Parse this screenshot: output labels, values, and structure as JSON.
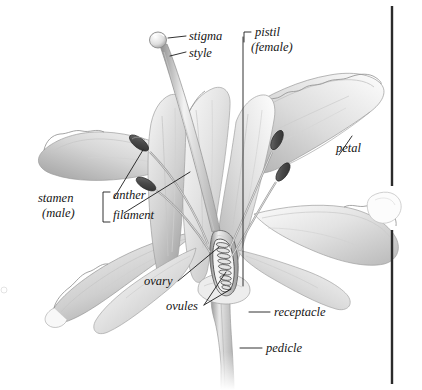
{
  "figure": {
    "style": "grayscale pencil botanical illustration",
    "background_color": "#ffffff",
    "ink_color": "#1b1b1b",
    "rule_color": "#2b2b2b"
  },
  "labels": {
    "stigma": "stigma",
    "style": "style",
    "pistil_line1": "pistil",
    "pistil_line2": "(female)",
    "petal": "petal",
    "stamen_line1": "stamen",
    "stamen_line2": "(male)",
    "anther": "anther",
    "filament": "filament",
    "ovary": "ovary",
    "ovules": "ovules",
    "receptacle": "receptacle",
    "pedicle": "pedicle"
  },
  "groups": {
    "pistil_members": [
      "stigma",
      "style",
      "ovary",
      "ovules"
    ],
    "stamen_members": [
      "anther",
      "filament"
    ]
  },
  "parts": {
    "petal_count": 6,
    "stamen_count": 4,
    "ovule_count": 9
  }
}
